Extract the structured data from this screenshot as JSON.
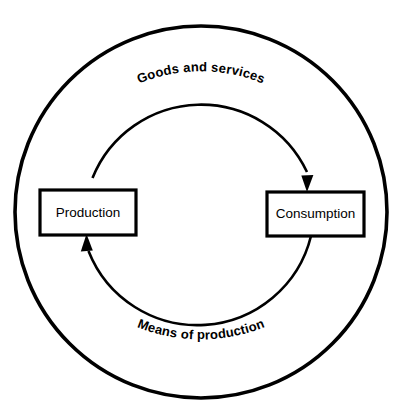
{
  "diagram": {
    "type": "cycle-diagram",
    "background_color": "#ffffff",
    "stroke_color": "#000000",
    "nodes": [
      {
        "id": "production",
        "label": "Production",
        "shape": "rectangle",
        "position": "left",
        "x": 40,
        "y": 190,
        "width": 96,
        "height": 45
      },
      {
        "id": "consumption",
        "label": "Consumption",
        "shape": "rectangle",
        "position": "right",
        "x": 267,
        "y": 192,
        "width": 97,
        "height": 44
      }
    ],
    "arc_labels": [
      {
        "id": "goods-and-services",
        "text": "Goods and services",
        "position": "top",
        "along": "outer-circle",
        "direction": "production-to-consumption"
      },
      {
        "id": "means-of-production",
        "text": "Means of production",
        "position": "bottom",
        "along": "outer-circle",
        "direction": "consumption-to-production"
      }
    ],
    "flows": [
      {
        "id": "flow-top",
        "from": "production",
        "to": "consumption",
        "path": "inner-arc-upper",
        "arrowhead": "down-into-consumption-top"
      },
      {
        "id": "flow-bottom",
        "from": "consumption",
        "to": "production",
        "path": "inner-arc-lower",
        "arrowhead": "up-into-production-bottom"
      }
    ],
    "geometry": {
      "outer_circle": {
        "cx": 201,
        "cy": 212,
        "r": 186
      },
      "inner_circle": {
        "cx": 201,
        "cy": 218,
        "r": 117
      }
    }
  }
}
